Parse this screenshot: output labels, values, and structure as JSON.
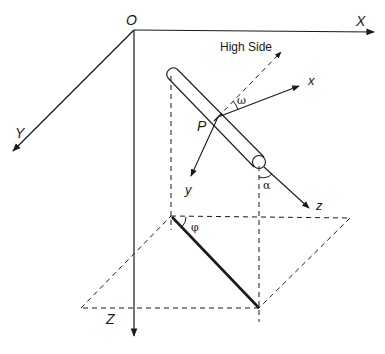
{
  "diagram": {
    "global_axes": {
      "origin_label": "O",
      "x_label": "X",
      "y_label": "Y",
      "z_label": "Z"
    },
    "local_axes": {
      "point_label": "P",
      "x_label": "x",
      "y_label": "y",
      "z_label": "z"
    },
    "high_side_label": "High Side",
    "angles": {
      "tool_face": "ω",
      "inclination": "α",
      "azimuth": "φ"
    },
    "colors": {
      "line": "#1a1a1a",
      "background": "#ffffff"
    }
  }
}
